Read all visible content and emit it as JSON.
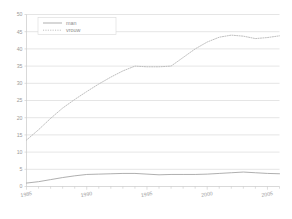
{
  "chart_data": {
    "type": "line",
    "title": "",
    "subtitle": "",
    "xlabel": "",
    "ylabel": "",
    "xlim": [
      1985,
      2006
    ],
    "ylim": [
      0,
      50
    ],
    "grid": true,
    "grid_axis": "y",
    "legend_position": "top-left-inside",
    "y_ticks": [
      0,
      5,
      10,
      15,
      20,
      25,
      30,
      35,
      40,
      45,
      50
    ],
    "y_tick_labels": [
      "0",
      "5",
      "10",
      "15",
      "20",
      "25",
      "30",
      "35",
      "40",
      "45",
      "50"
    ],
    "x_ticks": [
      1985,
      1990,
      1995,
      2000,
      2005
    ],
    "x_tick_labels": [
      "1985",
      "1990",
      "1995",
      "2000",
      "2005"
    ],
    "x_minor_ticks": [
      1985,
      1986,
      1987,
      1988,
      1989,
      1990,
      1991,
      1992,
      1993,
      1994,
      1995,
      1996,
      1997,
      1998,
      1999,
      2000,
      2001,
      2002,
      2003,
      2004,
      2005,
      2006
    ],
    "x": [
      1985,
      1986,
      1987,
      1988,
      1989,
      1990,
      1991,
      1992,
      1993,
      1994,
      1995,
      1996,
      1997,
      1998,
      1999,
      2000,
      2001,
      2002,
      2003,
      2004,
      2005,
      2006
    ],
    "series": [
      {
        "name": "man",
        "style": "solid",
        "color": "#a0a0a0",
        "values": [
          1.0,
          1.4,
          2.0,
          2.6,
          3.1,
          3.5,
          3.6,
          3.7,
          3.8,
          3.8,
          3.6,
          3.4,
          3.5,
          3.5,
          3.5,
          3.6,
          3.8,
          4.0,
          4.2,
          4.0,
          3.8,
          3.7
        ]
      },
      {
        "name": "vrouw",
        "style": "dotted",
        "color": "#b4b4b4",
        "values": [
          13.5,
          16.5,
          19.8,
          22.8,
          25.3,
          27.6,
          29.8,
          31.8,
          33.6,
          35.0,
          34.8,
          34.8,
          35.0,
          37.5,
          40.0,
          42.0,
          43.4,
          44.0,
          43.7,
          43.0,
          43.3,
          43.8
        ]
      }
    ],
    "legend_entries": [
      {
        "label": "man",
        "style": "solid",
        "color": "#a0a0a0"
      },
      {
        "label": "vrouw",
        "style": "dotted",
        "color": "#b4b4b4"
      }
    ],
    "colors": {
      "background": "#ffffff",
      "gridline": "#d4d4d4",
      "axis": "#c8c8c8",
      "tick_text": "#9a9a9a",
      "legend_box": "#d9d9d9",
      "man_line": "#a0a0a0",
      "vrouw_line": "#b4b4b4"
    }
  }
}
